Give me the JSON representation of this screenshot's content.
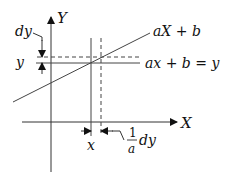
{
  "diagram": {
    "axes": {
      "x_label": "X",
      "y_label": "Y"
    },
    "line_label": "aX + b",
    "equation_label": "ax + b = y",
    "y_value_label": "y",
    "x_value_label": "x",
    "dy_label": "dy",
    "dx_label": {
      "numerator": "1",
      "denominator": "a",
      "suffix": "dy"
    },
    "colors": {
      "stroke": "#333333",
      "text": "#111111",
      "background": "#ffffff"
    }
  }
}
